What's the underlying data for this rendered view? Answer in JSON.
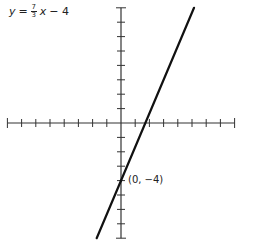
{
  "equation": {
    "lhs": "y",
    "equals": "=",
    "numerator": "7",
    "denominator": "3",
    "variable": "x",
    "rest": "− 4"
  },
  "point_label": "(0, −4)",
  "chart_data": {
    "type": "line",
    "function": {
      "slope": 2.3333,
      "intercept": -4
    },
    "xlim": [
      -8,
      8
    ],
    "ylim": [
      -8,
      8
    ],
    "x_ticks": [
      -8,
      -7,
      -6,
      -5,
      -4,
      -3,
      -2,
      -1,
      1,
      2,
      3,
      4,
      5,
      6,
      7,
      8
    ],
    "y_ticks": [
      -8,
      -7,
      -6,
      -5,
      -4,
      -3,
      -2,
      -1,
      1,
      2,
      3,
      4,
      5,
      6,
      7,
      8
    ],
    "series": [
      {
        "name": "y = 7/3 x − 4",
        "x": [
          -1.714,
          5.143
        ],
        "y": [
          -8,
          8
        ]
      }
    ],
    "annotations": [
      {
        "text": "(0, −4)",
        "x": 0,
        "y": -4
      }
    ],
    "grid": false,
    "line_color": "#111111",
    "axis_color": "#333333"
  }
}
